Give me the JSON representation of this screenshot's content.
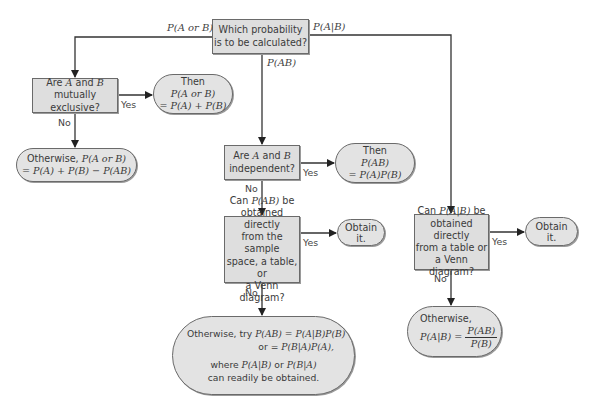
{
  "diagram": {
    "type": "flowchart",
    "colors": {
      "box_fill": "#dedede",
      "pill_fill": "#e3e3e3",
      "stroke": "#333333",
      "text": "#3a3a3a"
    },
    "start": {
      "text_l1": "Which probability",
      "text_l2": "is to be calculated?"
    },
    "branch_labels": {
      "left": "P(A or B)",
      "middle": "P(AB)",
      "right": "P(A|B)"
    },
    "left": {
      "question": {
        "l1_pre": "Are ",
        "l1_a": "A",
        "l1_mid": " and ",
        "l1_b": "B",
        "l2": "mutually exclusive?"
      },
      "yes_label": "Yes",
      "no_label": "No",
      "yes_result": {
        "l1": "Then",
        "l2": "P(A or B)",
        "l3": "= P(A) + P(B)"
      },
      "no_result": {
        "l1_pre": "Otherwise, ",
        "l1_math": "P(A or B)",
        "l2": "= P(A) + P(B) − P(AB)"
      }
    },
    "middle": {
      "question1": {
        "l1_pre": "Are ",
        "l1_a": "A",
        "l1_mid": " and ",
        "l1_b": "B",
        "l2": "independent?"
      },
      "yes1_label": "Yes",
      "no1_label": "No",
      "yes1_result": {
        "l1": "Then",
        "l2": "P(AB)",
        "l3": "= P(A)P(B)"
      },
      "question2": {
        "l1_pre": "Can ",
        "l1_math": "P(AB)",
        "l1_post": " be",
        "l2": "obtained directly",
        "l3": "from the sample",
        "l4": "space, a table, or",
        "l5": "a Venn diagram?"
      },
      "yes2_label": "Yes",
      "no2_label": "No",
      "yes2_result": {
        "l1": "Obtain",
        "l2": "it."
      },
      "no2_result": {
        "l1_pre": "Otherwise, try ",
        "l1_math": "P(AB) = P(A|B)P(B)",
        "l2_pre": "or = ",
        "l2_math": "P(B|A)P(A),",
        "l3_pre": "where ",
        "l3_math1": "P(A|B)",
        "l3_mid": " or ",
        "l3_math2": "P(B|A)",
        "l4": "can readily be obtained."
      }
    },
    "right": {
      "question": {
        "l1_pre": "Can ",
        "l1_math": "P(A|B)",
        "l1_post": " be",
        "l2": "obtained directly",
        "l3": "from a table or",
        "l4": "a Venn diagram?"
      },
      "yes_label": "Yes",
      "no_label": "No",
      "yes_result": {
        "l1": "Obtain",
        "l2": "it."
      },
      "no_result": {
        "l1": "Otherwise,",
        "lhs": "P(A|B) =",
        "num": "P(AB)",
        "den": "P(B)"
      }
    }
  }
}
